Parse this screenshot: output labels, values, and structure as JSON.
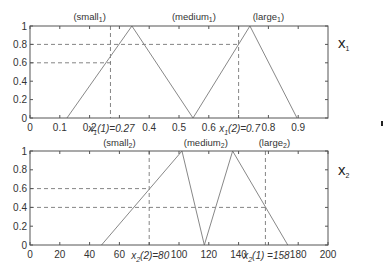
{
  "chart_data": [
    {
      "type": "line",
      "title": "",
      "variable_label": "x",
      "variable_sub": "1",
      "xlabel": "",
      "ylabel": "",
      "xlim": [
        0,
        1.0
      ],
      "ylim": [
        0,
        1
      ],
      "xticks": [
        0,
        0.1,
        0.2,
        0.3,
        0.4,
        0.5,
        0.6,
        0.7,
        0.8,
        0.9
      ],
      "xtick_labels": [
        "0",
        "0.1",
        "0.2",
        "",
        "0.4",
        "0.5",
        "0.6",
        "",
        "0.8",
        "0.9"
      ],
      "yticks": [
        0,
        0.2,
        0.4,
        0.6,
        0.8,
        1
      ],
      "ytick_labels": [
        "0",
        "0.2",
        "0.4",
        "0.6",
        "0.8",
        "1"
      ],
      "set_labels": [
        {
          "name": "small",
          "sub": "1",
          "x": 0.2
        },
        {
          "name": "medium",
          "sub": "1",
          "x": 0.55
        },
        {
          "name": "large",
          "sub": "1",
          "x": 0.8
        }
      ],
      "series": [
        {
          "name": "small1-medium1",
          "x": [
            0.124,
            0.342,
            0.547
          ],
          "y": [
            0,
            1,
            0
          ]
        },
        {
          "name": "medium1-large1",
          "x": [
            0.547,
            0.738,
            0.896
          ],
          "y": [
            0,
            1,
            0
          ]
        }
      ],
      "guides": {
        "vertical": [
          0.27,
          0.7
        ],
        "horizontal": [
          0.6,
          0.8
        ],
        "horizontal_extent": [
          {
            "y": 0.6,
            "x_to": 0.27
          },
          {
            "y": 0.8,
            "x_to": 0.7
          }
        ]
      },
      "annotations": [
        {
          "text_pre": "x",
          "sub": "1",
          "text_post": "(1)=0.27",
          "x": 0.27
        },
        {
          "text_pre": "x",
          "sub": "1",
          "text_post": "(2)=0.7",
          "x": 0.7
        }
      ]
    },
    {
      "type": "line",
      "title": "",
      "variable_label": "x",
      "variable_sub": "2",
      "xlabel": "",
      "ylabel": "",
      "xlim": [
        0,
        200
      ],
      "ylim": [
        0,
        1
      ],
      "xticks": [
        0,
        20,
        40,
        60,
        80,
        100,
        120,
        140,
        160,
        180,
        200
      ],
      "xtick_labels": [
        "0",
        "20",
        "40",
        "60",
        "",
        "100",
        "120",
        "140",
        "",
        "180",
        "200"
      ],
      "yticks": [
        0,
        0.2,
        0.4,
        0.6,
        0.8,
        1
      ],
      "ytick_labels": [
        "0",
        "0.2",
        "0.4",
        "0.6",
        "0.8",
        "1"
      ],
      "set_labels": [
        {
          "name": "small",
          "sub": "2",
          "x": 60
        },
        {
          "name": "medium",
          "sub": "2",
          "x": 118
        },
        {
          "name": "large",
          "sub": "2",
          "x": 164
        }
      ],
      "series": [
        {
          "name": "small2-medium2",
          "x": [
            48,
            102,
            117
          ],
          "y": [
            0,
            1,
            0
          ]
        },
        {
          "name": "medium2-large2",
          "x": [
            117,
            136,
            173
          ],
          "y": [
            0,
            1,
            0
          ]
        }
      ],
      "guides": {
        "vertical": [
          80,
          158
        ],
        "horizontal": [
          0.6,
          0.4
        ],
        "horizontal_extent": [
          {
            "y": 0.6,
            "x_to": 80
          },
          {
            "y": 0.4,
            "x_to": 158
          }
        ]
      },
      "annotations": [
        {
          "text_pre": "x",
          "sub": "2",
          "text_post": "(2)=80",
          "x": 80
        },
        {
          "text_pre": "x",
          "sub": "2",
          "text_post": "(1) =158",
          "x": 158
        }
      ]
    }
  ]
}
